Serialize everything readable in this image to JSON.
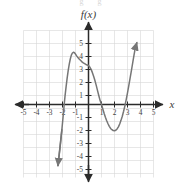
{
  "figure": {
    "function_label": "f(x)",
    "x_axis_label": "x",
    "top_partial_text": "g  g"
  },
  "colors": {
    "curve": "#767676",
    "axis": "#2b2b2b",
    "grid": "#d6d6d6",
    "tick_text": "#3f3f3f",
    "background": "#ffffff"
  },
  "chart_data": {
    "type": "line",
    "title": "",
    "subtitle": "",
    "xlabel": "x",
    "ylabel": "f(x)",
    "xlim": [
      -5.5,
      5.5
    ],
    "ylim": [
      -5.5,
      5.5
    ],
    "grid": true,
    "legend_position": "none",
    "x_ticks": [
      -5,
      -4,
      -3,
      -2,
      -1,
      1,
      2,
      3,
      4,
      5
    ],
    "y_ticks": [
      -5,
      -4,
      -3,
      -2,
      -1,
      1,
      2,
      3,
      4,
      5
    ],
    "x_tick_labels": [
      "-5",
      "-4",
      "-3",
      "-2",
      "-1",
      "1",
      "2",
      "3",
      "4",
      "5"
    ],
    "y_tick_labels": [
      "-5",
      "-4",
      "-3",
      "-2",
      "-1",
      "1",
      "2",
      "3",
      "4",
      "5"
    ],
    "series": [
      {
        "name": "f(x)",
        "kind": "cubic-polynomial",
        "arrow_start": true,
        "arrow_end": true,
        "annotations": {
          "local_maximum": [
            -1.3,
            4.0
          ],
          "local_minimum": [
            2.0,
            -2.0
          ],
          "x_intercepts": [
            -2.0,
            1.0,
            3.0
          ],
          "y_intercept": [
            0,
            3.0
          ],
          "start_point": [
            -2.35,
            -4.7
          ],
          "end_point": [
            3.72,
            4.75
          ]
        },
        "points": [
          [
            -2.35,
            -4.7
          ],
          [
            -2.25,
            -3.85
          ],
          [
            -2.15,
            -2.95
          ],
          [
            -2.05,
            -1.95
          ],
          [
            -1.95,
            -0.9
          ],
          [
            -1.88,
            -0.1
          ],
          [
            -1.8,
            0.7
          ],
          [
            -1.72,
            1.4
          ],
          [
            -1.64,
            2.05
          ],
          [
            -1.56,
            2.62
          ],
          [
            -1.48,
            3.1
          ],
          [
            -1.4,
            3.5
          ],
          [
            -1.32,
            3.8
          ],
          [
            -1.24,
            3.96
          ],
          [
            -1.16,
            4.02
          ],
          [
            -1.08,
            3.98
          ],
          [
            -1.0,
            3.88
          ],
          [
            -0.9,
            3.72
          ],
          [
            -0.8,
            3.6
          ],
          [
            -0.7,
            3.48
          ],
          [
            -0.6,
            3.38
          ],
          [
            -0.5,
            3.28
          ],
          [
            -0.4,
            3.2
          ],
          [
            -0.3,
            3.14
          ],
          [
            -0.2,
            3.08
          ],
          [
            -0.1,
            3.04
          ],
          [
            0.0,
            3.0
          ],
          [
            0.1,
            2.88
          ],
          [
            0.2,
            2.7
          ],
          [
            0.3,
            2.45
          ],
          [
            0.4,
            2.15
          ],
          [
            0.5,
            1.82
          ],
          [
            0.6,
            1.45
          ],
          [
            0.7,
            1.05
          ],
          [
            0.8,
            0.65
          ],
          [
            0.9,
            0.28
          ],
          [
            1.0,
            0.0
          ],
          [
            1.1,
            -0.35
          ],
          [
            1.2,
            -0.68
          ],
          [
            1.3,
            -0.98
          ],
          [
            1.4,
            -1.25
          ],
          [
            1.5,
            -1.48
          ],
          [
            1.6,
            -1.68
          ],
          [
            1.7,
            -1.84
          ],
          [
            1.8,
            -1.94
          ],
          [
            1.9,
            -2.0
          ],
          [
            2.0,
            -2.02
          ],
          [
            2.1,
            -1.98
          ],
          [
            2.2,
            -1.88
          ],
          [
            2.3,
            -1.72
          ],
          [
            2.4,
            -1.5
          ],
          [
            2.5,
            -1.22
          ],
          [
            2.6,
            -0.9
          ],
          [
            2.7,
            -0.52
          ],
          [
            2.8,
            -0.1
          ],
          [
            2.9,
            0.38
          ],
          [
            3.0,
            0.9
          ],
          [
            3.1,
            1.45
          ],
          [
            3.2,
            2.02
          ],
          [
            3.3,
            2.6
          ],
          [
            3.4,
            3.2
          ],
          [
            3.5,
            3.8
          ],
          [
            3.6,
            4.35
          ],
          [
            3.72,
            4.75
          ]
        ]
      }
    ]
  }
}
